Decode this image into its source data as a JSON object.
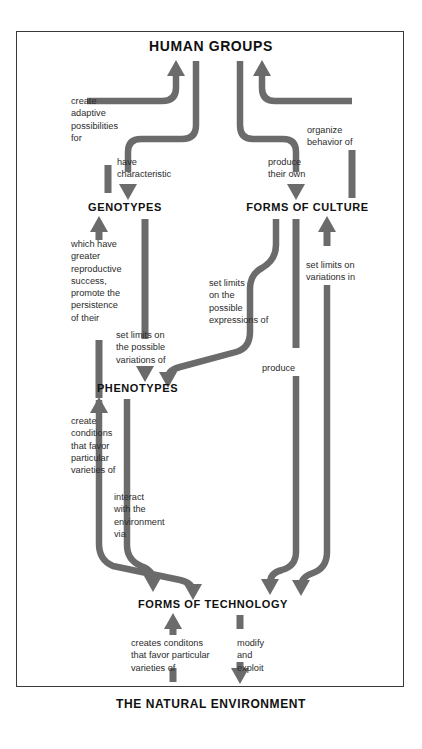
{
  "diagram": {
    "title_node": "HUMAN GROUPS",
    "type": "flow-diagram",
    "nodes": [
      {
        "id": "human-groups",
        "label": "HUMAN GROUPS",
        "x": 211,
        "y": 47,
        "size": 14
      },
      {
        "id": "genotypes",
        "label": "GENOTYPES",
        "x": 125,
        "y": 209,
        "size": 11
      },
      {
        "id": "forms-of-culture",
        "label": "FORMS OF CULTURE",
        "x": 307,
        "y": 209,
        "size": 11
      },
      {
        "id": "phenotypes",
        "label": "PHENOTYPES",
        "x": 137,
        "y": 390,
        "size": 11
      },
      {
        "id": "forms-of-technology",
        "label": "FORMS OF TECHNOLOGY",
        "x": 213,
        "y": 606,
        "size": 11
      },
      {
        "id": "the-natural-environment",
        "label": "THE NATURAL ENVIRONMENT",
        "x": 211,
        "y": 706,
        "size": 12
      }
    ],
    "edge_labels": [
      {
        "id": "create-adaptive-possibilities-for",
        "text": "create\nadaptive\npossibilities\nfor",
        "x": 71,
        "y": 95
      },
      {
        "id": "have-characteristic",
        "text": "have\ncharacteristic",
        "x": 110,
        "y": 157
      },
      {
        "id": "produce-their-own",
        "text": "produce\ntheir own",
        "x": 268,
        "y": 157
      },
      {
        "id": "organize-behavior-of",
        "text": "organize\nbehavior of",
        "x": 330,
        "y": 124
      },
      {
        "id": "which-have-greater-reproductive-success",
        "text": "which have\ngreater\nreproductive\nsuccess,\npromote the\npersistence\nof their",
        "x": 71,
        "y": 237
      },
      {
        "id": "set-limits-on-the-possible-variations-of",
        "text": "set limits on\nthe possible\nvariations of",
        "x": 116,
        "y": 330
      },
      {
        "id": "set-limits-on-the-possible-expressions-of",
        "text": "set limits\non the\npossible\nexpressions of",
        "x": 208,
        "y": 278
      },
      {
        "id": "set-limits-on-variations-in",
        "text": "set limits on\nvariations in",
        "x": 306,
        "y": 258
      },
      {
        "id": "produce",
        "text": "produce",
        "x": 264,
        "y": 364
      },
      {
        "id": "create-conditions-that-favor-particular-varieties-of",
        "text": "create\nconditions\nthat favor\nparticular\nvarieties of",
        "x": 71,
        "y": 415
      },
      {
        "id": "interact-with-the-environment-via",
        "text": "interact\nwith the\nenvironment\nvia",
        "x": 114,
        "y": 490
      },
      {
        "id": "creates-conditons-that-favor-particular-varieties-of",
        "text": "creates conditons\nthat favor particular\nvarieties of",
        "x": 132,
        "y": 638
      },
      {
        "id": "modify-and-exploit",
        "text": "modify\nand\nexploit",
        "x": 238,
        "y": 638
      }
    ],
    "colors": {
      "ribbon": "#6b6b6b",
      "text": "#2b2b2b",
      "node_text": "#111111",
      "frame_border": "#3a3a3a",
      "background": "#ffffff"
    }
  }
}
